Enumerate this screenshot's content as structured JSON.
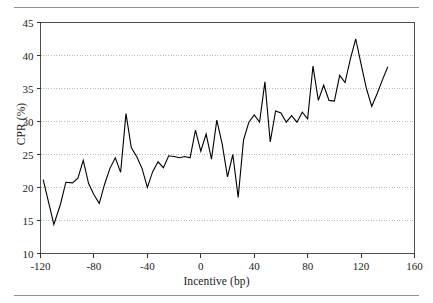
{
  "figure": {
    "rule_color": "#8f8f8f",
    "background": "#ffffff"
  },
  "chart_data": {
    "type": "line",
    "title": "",
    "xlabel": "Incentive (bp)",
    "ylabel": "CPR (%)",
    "xlim": [
      -120,
      160
    ],
    "ylim": [
      10,
      45
    ],
    "xticks": [
      -120,
      -80,
      -40,
      0,
      40,
      80,
      120,
      160
    ],
    "yticks": [
      10,
      15,
      20,
      25,
      30,
      35,
      40,
      45
    ],
    "xtick_labels": [
      "-120",
      "-80",
      "-40",
      "0",
      "40",
      "80",
      "120",
      "160"
    ],
    "ytick_labels": [
      "10",
      "15",
      "20",
      "25",
      "30",
      "35",
      "40",
      "45"
    ],
    "grid": true,
    "grid_axis": "y",
    "grid_style": "dotted",
    "grid_color": "#b4b4b4",
    "legend": false,
    "line_color": "#000000",
    "line_width": 1.1,
    "series": [
      {
        "name": "CPR",
        "x": [
          -118,
          -110,
          -105,
          -101,
          -96,
          -92,
          -88,
          -84,
          -80,
          -76,
          -72,
          -68,
          -64,
          -60,
          -56,
          -52,
          -48,
          -44,
          -40,
          -36,
          -32,
          -28,
          -24,
          -20,
          -16,
          -12,
          -8,
          -4,
          0,
          4,
          8,
          12,
          16,
          20,
          24,
          28,
          32,
          36,
          40,
          44,
          48,
          52,
          56,
          60,
          64,
          68,
          72,
          76,
          80,
          84,
          88,
          92,
          96,
          100,
          104,
          108,
          112,
          116,
          120,
          124,
          128,
          132,
          136,
          140
        ],
        "y": [
          21.2,
          14.4,
          17.5,
          20.8,
          20.7,
          21.4,
          24.1,
          20.6,
          18.9,
          17.6,
          20.5,
          22.9,
          24.5,
          22.3,
          31.2,
          26.0,
          24.7,
          22.9,
          20.0,
          22.4,
          23.9,
          23.0,
          24.8,
          24.7,
          24.5,
          24.7,
          24.5,
          28.7,
          25.5,
          28.1,
          24.3,
          30.2,
          26.6,
          21.6,
          25.0,
          18.5,
          27.2,
          29.9,
          31.0,
          29.9,
          36.0,
          26.9,
          31.6,
          31.3,
          29.9,
          30.9,
          29.9,
          31.4,
          30.4,
          38.4,
          33.2,
          35.5,
          33.2,
          33.1,
          37.0,
          35.9,
          39.5,
          42.5,
          38.7,
          35.0,
          32.3,
          34.2,
          36.3,
          38.3
        ]
      }
    ]
  }
}
